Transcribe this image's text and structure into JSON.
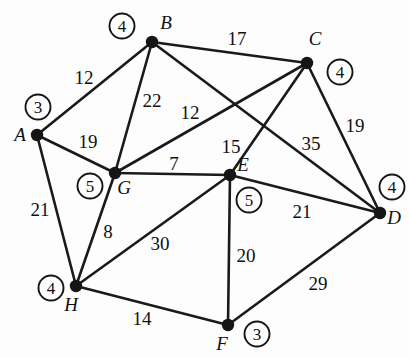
{
  "figure": {
    "background_color": "#fdfdfd",
    "stroke_color": "#1a1a1a",
    "width": 409,
    "height": 357
  },
  "chart_data": {
    "type": "diagram",
    "subtype": "node-link-graph",
    "title": "",
    "directed": false,
    "weighted": true,
    "nodes": [
      {
        "id": "A",
        "label": "A",
        "x": 37,
        "y": 135,
        "label_x": 20,
        "label_y": 141,
        "badge": "3",
        "badge_x": 38,
        "badge_y": 107
      },
      {
        "id": "B",
        "label": "B",
        "x": 152,
        "y": 42,
        "label_x": 166,
        "label_y": 29,
        "badge": "4",
        "badge_x": 122,
        "badge_y": 26
      },
      {
        "id": "C",
        "label": "C",
        "x": 307,
        "y": 63,
        "label_x": 315,
        "label_y": 45,
        "badge": "4",
        "badge_x": 340,
        "badge_y": 72
      },
      {
        "id": "D",
        "label": "D",
        "x": 380,
        "y": 213,
        "label_x": 394,
        "label_y": 224,
        "badge": "4",
        "badge_x": 392,
        "badge_y": 187
      },
      {
        "id": "E",
        "label": "E",
        "x": 230,
        "y": 175,
        "label_x": 243,
        "label_y": 171,
        "badge": "5",
        "badge_x": 249,
        "badge_y": 200
      },
      {
        "id": "F",
        "label": "F",
        "x": 228,
        "y": 325,
        "label_x": 222,
        "label_y": 350,
        "badge": "3",
        "badge_x": 257,
        "badge_y": 334
      },
      {
        "id": "G",
        "label": "G",
        "x": 115,
        "y": 173,
        "label_x": 124,
        "label_y": 194,
        "badge": "5",
        "badge_x": 90,
        "badge_y": 186
      },
      {
        "id": "H",
        "label": "H",
        "x": 76,
        "y": 286,
        "label_x": 71,
        "label_y": 311,
        "badge": "4",
        "badge_x": 51,
        "badge_y": 288
      }
    ],
    "edges": [
      {
        "source": "A",
        "target": "B",
        "weight": "12",
        "label_x": 84,
        "label_y": 84
      },
      {
        "source": "A",
        "target": "G",
        "weight": "19",
        "label_x": 88,
        "label_y": 148
      },
      {
        "source": "A",
        "target": "H",
        "weight": "21",
        "label_x": 40,
        "label_y": 216
      },
      {
        "source": "B",
        "target": "C",
        "weight": "17",
        "label_x": 237,
        "label_y": 45
      },
      {
        "source": "B",
        "target": "G",
        "weight": "22",
        "label_x": 152,
        "label_y": 107
      },
      {
        "source": "B",
        "target": "D",
        "weight": "35",
        "label_x": 311,
        "label_y": 150
      },
      {
        "source": "C",
        "target": "G",
        "weight": "12",
        "label_x": 190,
        "label_y": 119
      },
      {
        "source": "C",
        "target": "E",
        "weight": "15",
        "label_x": 231,
        "label_y": 153
      },
      {
        "source": "C",
        "target": "D",
        "weight": "19",
        "label_x": 355,
        "label_y": 132
      },
      {
        "source": "G",
        "target": "E",
        "weight": "7",
        "label_x": 174,
        "label_y": 170
      },
      {
        "source": "G",
        "target": "H",
        "weight": "8",
        "label_x": 108,
        "label_y": 238
      },
      {
        "source": "E",
        "target": "H",
        "weight": "30",
        "label_x": 160,
        "label_y": 250
      },
      {
        "source": "E",
        "target": "D",
        "weight": "21",
        "label_x": 302,
        "label_y": 218
      },
      {
        "source": "E",
        "target": "F",
        "weight": "20",
        "label_x": 246,
        "label_y": 262
      },
      {
        "source": "H",
        "target": "F",
        "weight": "14",
        "label_x": 142,
        "label_y": 325
      },
      {
        "source": "F",
        "target": "D",
        "weight": "29",
        "label_x": 318,
        "label_y": 290
      }
    ],
    "vertex_badges_meaning": "circled number beside each vertex = vertex degree",
    "xlabel": "",
    "ylabel": "",
    "legend": []
  }
}
